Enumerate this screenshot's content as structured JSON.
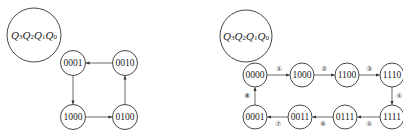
{
  "left_diagram": {
    "header_label": {
      "main": [
        "Q",
        "Q",
        "Q",
        "Q"
      ],
      "subs": [
        "3",
        "2",
        "1",
        "0"
      ]
    },
    "states": [
      {
        "id": "s0001",
        "label": "0001",
        "x": 73,
        "y": 63
      },
      {
        "id": "s0010",
        "label": "0010",
        "x": 125,
        "y": 63
      },
      {
        "id": "s1000",
        "label": "1000",
        "x": 73,
        "y": 117
      },
      {
        "id": "s0100",
        "label": "0100",
        "x": 125,
        "y": 117
      }
    ],
    "transitions": [
      {
        "from": "0001",
        "to": "1000"
      },
      {
        "from": "1000",
        "to": "0100"
      },
      {
        "from": "0100",
        "to": "0010"
      },
      {
        "from": "0010",
        "to": "0001"
      }
    ]
  },
  "right_diagram": {
    "header_label": {
      "main": [
        "Q",
        "Q",
        "Q",
        "Q"
      ],
      "subs": [
        "3",
        "2",
        "1",
        "0"
      ]
    },
    "states": [
      {
        "id": "s0000",
        "label": "0000",
        "x": 255,
        "y": 75
      },
      {
        "id": "s1000",
        "label": "1000",
        "x": 302,
        "y": 75
      },
      {
        "id": "s1100",
        "label": "1100",
        "x": 347,
        "y": 75
      },
      {
        "id": "s1110",
        "label": "1110",
        "x": 392,
        "y": 75
      },
      {
        "id": "s1111",
        "label": "1111",
        "x": 392,
        "y": 117
      },
      {
        "id": "s0111",
        "label": "0111",
        "x": 345,
        "y": 117
      },
      {
        "id": "s0011",
        "label": "0011",
        "x": 300,
        "y": 117
      },
      {
        "id": "s0001",
        "label": "0001",
        "x": 255,
        "y": 117
      }
    ],
    "transitions": [
      {
        "from": "0000",
        "to": "1000",
        "step": "①"
      },
      {
        "from": "1000",
        "to": "1100",
        "step": "②"
      },
      {
        "from": "1100",
        "to": "1110",
        "step": "③"
      },
      {
        "from": "1110",
        "to": "1111",
        "step": "④"
      },
      {
        "from": "1111",
        "to": "0111",
        "step": "⑤"
      },
      {
        "from": "0111",
        "to": "0011",
        "step": "⑥"
      },
      {
        "from": "0011",
        "to": "0001",
        "step": "⑦"
      },
      {
        "from": "0001",
        "to": "0000",
        "step": "⑧"
      }
    ]
  }
}
